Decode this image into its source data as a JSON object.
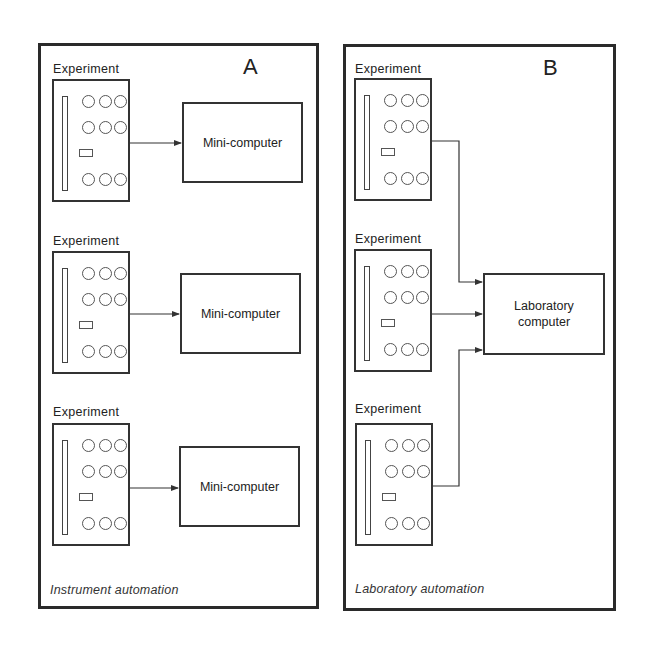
{
  "panels": {
    "a": {
      "letter": "A",
      "caption": "Instrument automation",
      "experiments": [
        {
          "label": "Experiment",
          "computer": "Mini-computer"
        },
        {
          "label": "Experiment",
          "computer": "Mini-computer"
        },
        {
          "label": "Experiment",
          "computer": "Mini-computer"
        }
      ]
    },
    "b": {
      "letter": "B",
      "caption": "Laboratory automation",
      "experiments": [
        {
          "label": "Experiment"
        },
        {
          "label": "Experiment"
        },
        {
          "label": "Experiment"
        }
      ],
      "computer": "Laboratory\ncomputer"
    }
  }
}
